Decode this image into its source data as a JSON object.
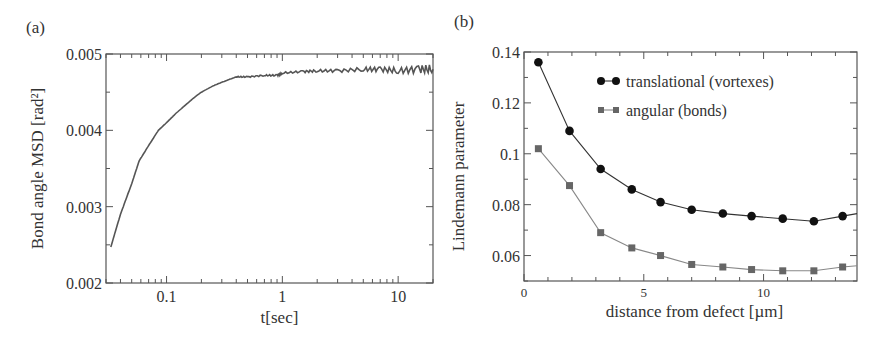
{
  "figure": {
    "panels": [
      {
        "label": "(a)"
      },
      {
        "label": "(b)"
      }
    ]
  },
  "colors": {
    "axis": "#555555",
    "curve_a": "#555555",
    "series_translational": "#111111",
    "series_angular": "#666666",
    "line_translational": "#333333",
    "line_angular": "#888888"
  },
  "chart_data": [
    {
      "panel": "(a)",
      "type": "line",
      "title": "",
      "xlabel": "t[sec]",
      "ylabel": "Bond angle MSD [rad²]",
      "xscale": "log",
      "xlim": [
        0.03,
        20
      ],
      "ylim": [
        0.002,
        0.005
      ],
      "xticks": [
        {
          "value": 0.1,
          "label": "0.1"
        },
        {
          "value": 1,
          "label": "1"
        },
        {
          "value": 10,
          "label": "10"
        }
      ],
      "yticks": [
        {
          "value": 0.002,
          "label": "0.002"
        },
        {
          "value": 0.003,
          "label": "0.003"
        },
        {
          "value": 0.004,
          "label": "0.004"
        },
        {
          "value": 0.005,
          "label": "0.005"
        }
      ],
      "grid": false,
      "series": [
        {
          "name": "Bond angle MSD",
          "x": [
            0.033,
            0.04,
            0.05,
            0.058,
            0.07,
            0.085,
            0.1,
            0.12,
            0.138,
            0.17,
            0.2,
            0.25,
            0.3,
            0.4,
            0.5,
            0.7,
            0.9,
            1,
            1.5,
            2,
            3,
            5,
            7,
            10,
            15,
            20
          ],
          "y": [
            0.00247,
            0.0029,
            0.0033,
            0.0036,
            0.0038,
            0.004,
            0.0041,
            0.00422,
            0.0043,
            0.00442,
            0.0045,
            0.00458,
            0.00463,
            0.0047,
            0.0047,
            0.00472,
            0.00472,
            0.00475,
            0.00477,
            0.00478,
            0.00478,
            0.0048,
            0.0048,
            0.00478,
            0.0048,
            0.0048
          ]
        }
      ]
    },
    {
      "panel": "(b)",
      "type": "line",
      "title": "",
      "xlabel": "distance from defect [µm]",
      "ylabel": "Lindemann parameter",
      "xlim": [
        0,
        13.9
      ],
      "ylim": [
        0.05,
        0.14
      ],
      "xticks": [
        {
          "value": 0,
          "label": "0"
        },
        {
          "value": 5,
          "label": "5"
        },
        {
          "value": 10,
          "label": "10"
        }
      ],
      "yticks": [
        {
          "value": 0.06,
          "label": "0.06"
        },
        {
          "value": 0.08,
          "label": "0.08"
        },
        {
          "value": 0.1,
          "label": "0.1"
        },
        {
          "value": 0.12,
          "label": "0.12"
        },
        {
          "value": 0.14,
          "label": "0.14"
        }
      ],
      "grid": false,
      "legend": {
        "position": "upper right",
        "entries": [
          "translational (vortexes)",
          "angular (bonds)"
        ]
      },
      "x": [
        0.6,
        1.9,
        3.2,
        4.5,
        5.7,
        7.0,
        8.3,
        9.5,
        10.8,
        12.1,
        13.3
      ],
      "series": [
        {
          "name": "translational (vortexes)",
          "marker": "circle",
          "values": [
            0.136,
            0.109,
            0.094,
            0.086,
            0.081,
            0.078,
            0.0765,
            0.0755,
            0.0745,
            0.0735,
            0.0755
          ],
          "tail_to_edge": 0.0765
        },
        {
          "name": "angular (bonds)",
          "marker": "square",
          "values": [
            0.102,
            0.0875,
            0.069,
            0.063,
            0.06,
            0.0565,
            0.0555,
            0.0545,
            0.054,
            0.054,
            0.0555
          ],
          "tail_to_edge": 0.056
        }
      ]
    }
  ]
}
